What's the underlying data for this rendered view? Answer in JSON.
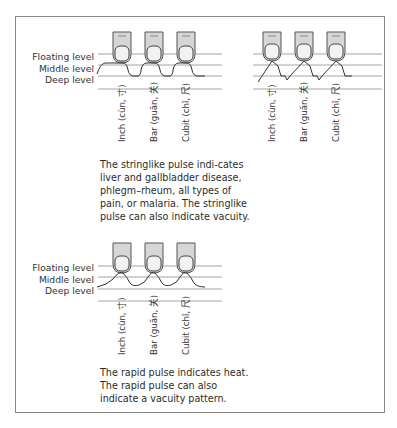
{
  "levels": {
    "floating": "Floating level",
    "middle": "Middle level",
    "deep": "Deep level"
  },
  "positions": {
    "inch": "Inch (cùn, 寸)",
    "bar": "Bar (guān, 关)",
    "cubit": "Cubit (chǐ, 尺)"
  },
  "panels": [
    {
      "id": "stringlike",
      "caption": "The stringlike pulse indi-cates liver and gallbladder disease, phlegm–rheum, all types of pain, or malaria. The stringlike pulse can also indicate vacuity."
    },
    {
      "id": "stringlike-variant",
      "caption": ""
    },
    {
      "id": "rapid",
      "caption": "The rapid pulse indicates heat. The rapid pulse can also indicate a vacuity pattern."
    }
  ],
  "colors": {
    "frame": "#8a8a8a",
    "finger": "#d6d6d6",
    "nail": "#f2f2f2",
    "level_line": "#9a9a9a"
  }
}
